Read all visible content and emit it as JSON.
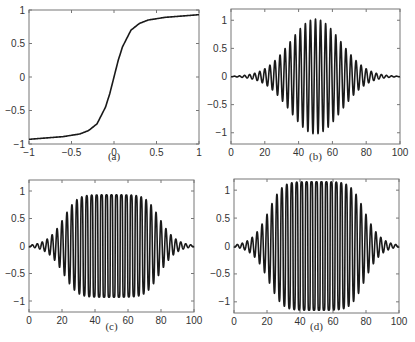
{
  "chart_data": [
    {
      "id": "a",
      "type": "line",
      "caption": "(a)",
      "title": "",
      "xlabel": "",
      "ylabel": "",
      "xlim": [
        -1,
        1
      ],
      "ylim": [
        -1,
        1
      ],
      "xticks": [
        -1,
        -0.5,
        0,
        0.5,
        1
      ],
      "xtick_labels": [
        "−1",
        "−0.5",
        "0",
        "0.5",
        "1"
      ],
      "yticks": [
        -1,
        -0.5,
        0,
        0.5,
        1
      ],
      "ytick_labels": [
        "−1",
        "−0.5",
        "0",
        "0.5",
        "1"
      ],
      "grid": false,
      "series": [
        {
          "name": "saturation function",
          "x": [
            -1,
            -0.8,
            -0.6,
            -0.4,
            -0.3,
            -0.2,
            -0.1,
            -0.05,
            0,
            0.05,
            0.1,
            0.2,
            0.3,
            0.4,
            0.6,
            0.8,
            1
          ],
          "y": [
            -0.93,
            -0.91,
            -0.89,
            -0.85,
            -0.8,
            -0.7,
            -0.45,
            -0.25,
            0,
            0.25,
            0.45,
            0.7,
            0.8,
            0.85,
            0.89,
            0.91,
            0.93
          ]
        }
      ]
    },
    {
      "id": "b",
      "type": "line",
      "caption": "(b)",
      "title": "",
      "xlabel": "",
      "ylabel": "",
      "xlim": [
        0,
        100
      ],
      "ylim": [
        -1.2,
        1.2
      ],
      "xticks": [
        0,
        20,
        40,
        60,
        80,
        100
      ],
      "xtick_labels": [
        "0",
        "20",
        "40",
        "60",
        "80",
        "100"
      ],
      "yticks": [
        -1,
        -0.5,
        0,
        0.5,
        1
      ],
      "ytick_labels": [
        "−1",
        "−0.5",
        "0",
        "0.5",
        "1"
      ],
      "grid": false,
      "series": [
        {
          "name": "gaussian-modulated sinusoid",
          "envelope_center": 50,
          "envelope_width": 15,
          "peak_amplitude": 1.02,
          "period": 3
        }
      ]
    },
    {
      "id": "c",
      "type": "line",
      "caption": "(c)",
      "title": "",
      "xlabel": "",
      "ylabel": "",
      "xlim": [
        0,
        100
      ],
      "ylim": [
        -1.2,
        1.2
      ],
      "xticks": [
        0,
        20,
        40,
        60,
        80,
        100
      ],
      "xtick_labels": [
        "0",
        "20",
        "40",
        "60",
        "80",
        "100"
      ],
      "yticks": [
        -1,
        -0.5,
        0,
        0.5,
        1
      ],
      "ytick_labels": [
        "−1",
        "−0.5",
        "0",
        "0.5",
        "1"
      ],
      "grid": false,
      "series": [
        {
          "name": "saturated signal",
          "envelope_center": 50,
          "envelope_width": 15,
          "input_gain": 4,
          "peak_amplitude": 0.93,
          "period": 3
        }
      ]
    },
    {
      "id": "d",
      "type": "line",
      "caption": "(d)",
      "title": "",
      "xlabel": "",
      "ylabel": "",
      "xlim": [
        0,
        100
      ],
      "ylim": [
        -1.2,
        1.2
      ],
      "xticks": [
        0,
        20,
        40,
        60,
        80,
        100
      ],
      "xtick_labels": [
        "0",
        "20",
        "40",
        "60",
        "80",
        "100"
      ],
      "yticks": [
        -1,
        -0.5,
        0,
        0.5,
        1
      ],
      "ytick_labels": [
        "−1",
        "−0.5",
        "0",
        "0.5",
        "1"
      ],
      "grid": false,
      "series": [
        {
          "name": "rescaled saturated signal",
          "envelope_center": 50,
          "envelope_width": 15,
          "input_gain": 4,
          "peak_amplitude": 1.15,
          "period": 3
        }
      ]
    }
  ]
}
